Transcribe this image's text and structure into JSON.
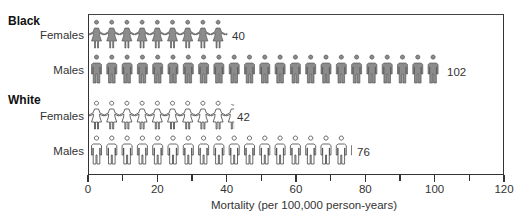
{
  "chart_data": {
    "type": "pictograph-bar",
    "title": "",
    "xlabel": "Mortality (per 100,000 person-years)",
    "ylabel": "",
    "xlim": [
      0,
      120
    ],
    "xticks_major": [
      0,
      20,
      40,
      60,
      80,
      100,
      120
    ],
    "xticks_minor": [
      10,
      30,
      50,
      70,
      90,
      110
    ],
    "grid": false,
    "legend": null,
    "groups": [
      {
        "name": "Black",
        "rows": [
          {
            "label": "Females",
            "value": 40,
            "icon": "female-figure",
            "style": "filled-gray"
          },
          {
            "label": "Males",
            "value": 102,
            "icon": "male-figure",
            "style": "filled-gray"
          }
        ]
      },
      {
        "name": "White",
        "rows": [
          {
            "label": "Females",
            "value": 42,
            "icon": "female-figure",
            "style": "outline-white"
          },
          {
            "label": "Males",
            "value": 76,
            "icon": "male-figure",
            "style": "outline-white"
          }
        ]
      }
    ],
    "categories": [
      "Black Females",
      "Black Males",
      "White Females",
      "White Males"
    ],
    "values": [
      40,
      102,
      42,
      76
    ]
  },
  "labels": {
    "group_black": "Black",
    "group_white": "White",
    "black_females": "Females",
    "black_males": "Males",
    "white_females": "Females",
    "white_males": "Males",
    "val_black_females": "40",
    "val_black_males": "102",
    "val_white_females": "42",
    "val_white_males": "76",
    "xlabel": "Mortality (per 100,000 person-years)",
    "ticks": [
      "0",
      "20",
      "40",
      "60",
      "80",
      "100",
      "120"
    ]
  },
  "colors": {
    "filled_icon": "#8c8c8c",
    "filled_icon_stroke": "#4a4a4a",
    "outline_icon_fill": "#ffffff",
    "outline_icon_stroke": "#444444",
    "axis": "#333333"
  }
}
